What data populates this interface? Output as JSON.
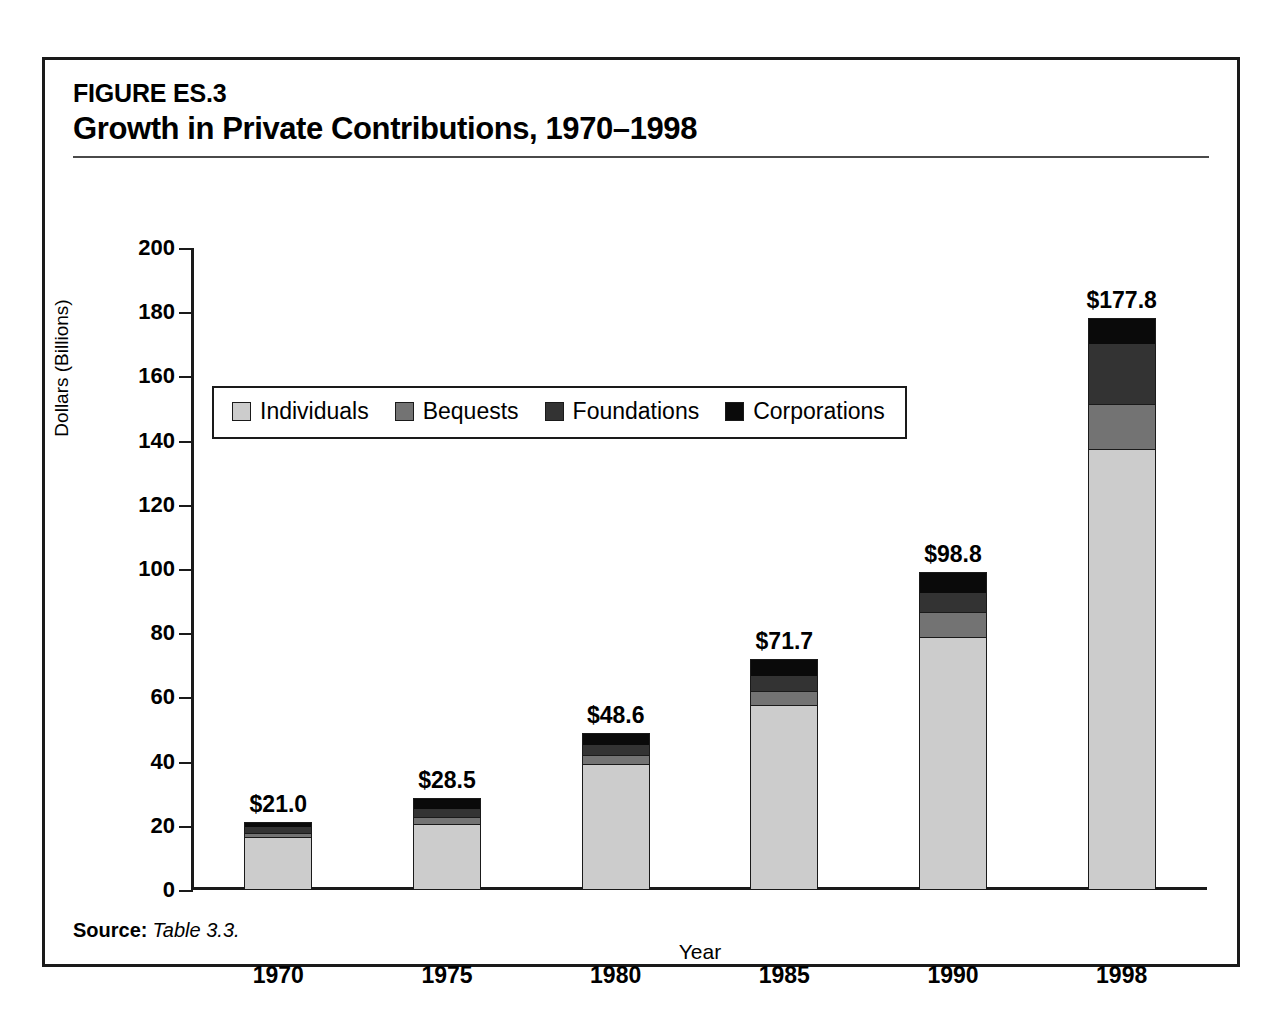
{
  "figure": {
    "number": "FIGURE ES.3",
    "title": "Growth in Private Contributions, 1970–1998",
    "source_label": "Source:",
    "source_text": "Table 3.3."
  },
  "chart_data": {
    "type": "bar",
    "subtype": "stacked-vertical",
    "title": "Growth in Private Contributions, 1970–1998",
    "subtitle": "FIGURE ES.3",
    "xlabel": "Year",
    "ylabel": "Dollars (Billions)",
    "ylim": [
      0,
      200
    ],
    "ytick_step": 20,
    "yticks": [
      0,
      20,
      40,
      60,
      80,
      100,
      120,
      140,
      160,
      180,
      200
    ],
    "ytick_labels": [
      "0",
      "20",
      "40",
      "60",
      "80",
      "100",
      "120",
      "140",
      "160",
      "180",
      "200"
    ],
    "grid": false,
    "legend_position": "top-left-inside",
    "categories": [
      "1970",
      "1975",
      "1980",
      "1985",
      "1990",
      "1998"
    ],
    "series": [
      {
        "name": "Individuals",
        "color": "#cccccc",
        "values": [
          16.2,
          20.3,
          39.0,
          57.4,
          78.4,
          137.0
        ]
      },
      {
        "name": "Bequests",
        "color": "#737373",
        "values": [
          1.4,
          2.2,
          2.9,
          4.3,
          8.0,
          14.0
        ]
      },
      {
        "name": "Foundations",
        "color": "#333333",
        "values": [
          1.9,
          2.6,
          3.3,
          4.9,
          6.2,
          19.0
        ]
      },
      {
        "name": "Corporations",
        "color": "#0a0a0a",
        "values": [
          1.5,
          3.4,
          3.4,
          5.1,
          6.2,
          7.8
        ]
      }
    ],
    "totals": [
      21.0,
      28.5,
      48.6,
      71.7,
      98.8,
      177.8
    ],
    "total_labels": [
      "$21.0",
      "$28.5",
      "$48.6",
      "$71.7",
      "$98.8",
      "$177.8"
    ]
  }
}
